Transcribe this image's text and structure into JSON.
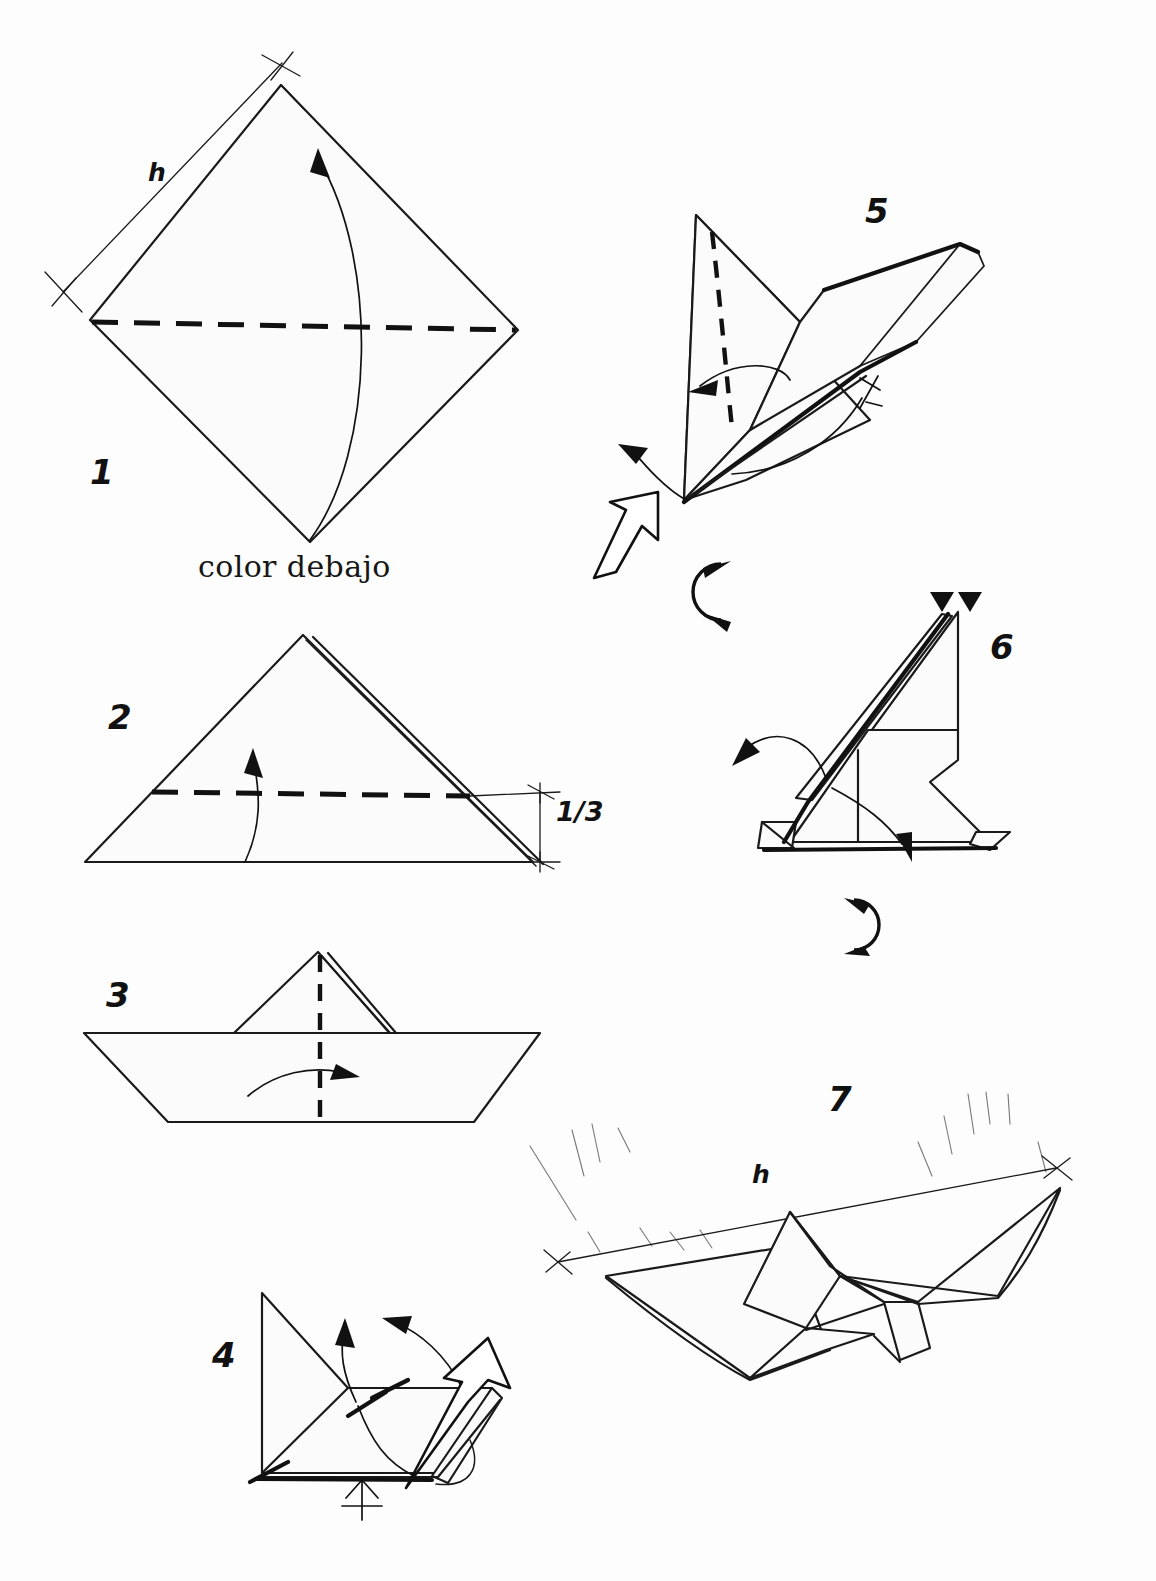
{
  "document": {
    "kind": "origami-folding-diagram",
    "title": "",
    "background_color": "#fdfdfd",
    "ink_color": "#111111"
  },
  "steps": [
    {
      "id": "step-1",
      "number": "1",
      "caption": "color debajo",
      "dimension_label": "h",
      "shape": "square rotated 45 degrees (diamond), white side up",
      "fold": "valley fold along horizontal diagonal",
      "arrows": [
        "curved up arrow"
      ],
      "markers": [
        "cross tick top",
        "cross tick left"
      ]
    },
    {
      "id": "step-2",
      "number": "2",
      "dimension_label": "1/3",
      "shape": "triangle, folded in half",
      "fold": "valley fold horizontal at 1/3 height from base",
      "arrows": [
        "curved up arrow"
      ],
      "markers": [
        "cross tick upper right",
        "cross tick lower right"
      ]
    },
    {
      "id": "step-3",
      "number": "3",
      "shape": "boat form with small triangle peak",
      "fold": "valley fold vertical centerline",
      "arrows": [
        "curved right arrow"
      ]
    },
    {
      "id": "step-4",
      "number": "4",
      "shape": "three dimensional partly opened form",
      "arrows": [
        "hollow open-out arrow",
        "curved up arrow",
        "curved over arrow"
      ],
      "markers": [
        "hidden-layer cross symbol"
      ]
    },
    {
      "id": "step-5",
      "number": "5",
      "shape": "three dimensional wing form",
      "fold": "hidden valley fold shown dashed",
      "arrows": [
        "hollow open-out arrow",
        "curved left arrow",
        "curved fold arrow"
      ],
      "markers": [
        "small cross tick"
      ],
      "rotate_symbol": true
    },
    {
      "id": "step-6",
      "number": "6",
      "shape": "three dimensional side view of body and wing",
      "arrows": [
        "curved left arrow",
        "curved down-right arrow",
        "two small v arrowheads"
      ],
      "rotate_symbol": true
    },
    {
      "id": "step-7",
      "number": "7",
      "dimension_label": "h",
      "shape": "finished bird with spread wings",
      "markers": [
        "cross tick left",
        "cross tick right",
        "sketch hatching"
      ]
    }
  ],
  "symbols": {
    "rotate_icon_name": "rotate-icon",
    "hollow_arrow_name": "open-out-arrow",
    "valley_fold_name": "valley-fold-dashed-line",
    "cross_tick_name": "measure-cross-tick"
  }
}
